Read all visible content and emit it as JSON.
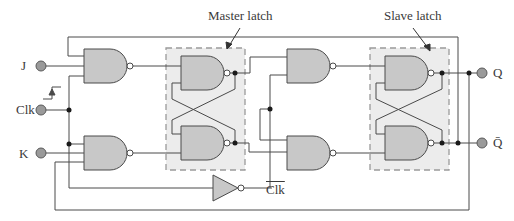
{
  "diagram": {
    "annotations": {
      "master_latch": "Master latch",
      "slave_latch": "Slave latch"
    },
    "inputs": {
      "j": "J",
      "clk": "Clk",
      "k": "K"
    },
    "outputs": {
      "q": "Q",
      "q_bar": "Q̄"
    },
    "inverter_output_label": "Clk",
    "colors": {
      "wire": "#4a4a4a",
      "gate_fill": "#c8c8c8",
      "latch_box_fill": "#ececec",
      "latch_box_border": "#9a9a9a",
      "terminal_fill": "#9a9a9a",
      "junction": "#1a1a1a"
    }
  }
}
